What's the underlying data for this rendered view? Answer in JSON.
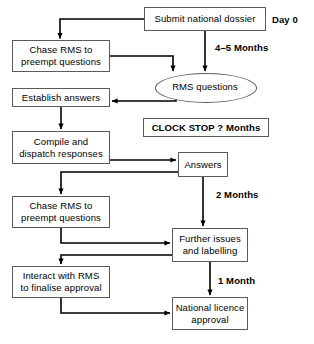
{
  "diagram": {
    "line_color": "#000000",
    "box_border_color": "#5a5a5a",
    "background": "#ffffff"
  },
  "nodes": [
    {
      "id": "submit-national-dossier",
      "label": "Submit national dossier",
      "shape": "rect",
      "x": 144,
      "y": 7,
      "w": 122,
      "h": 24
    },
    {
      "id": "chase-rms-1",
      "label": "Chase RMS to\npreempt questions",
      "shape": "rect",
      "x": 12,
      "y": 40,
      "w": 98,
      "h": 32
    },
    {
      "id": "rms-questions",
      "label": "RMS questions",
      "shape": "ellipse",
      "x": 155,
      "y": 73,
      "w": 100,
      "h": 28
    },
    {
      "id": "establish-answers",
      "label": "Establish answers",
      "shape": "rect",
      "x": 12,
      "y": 88,
      "w": 98,
      "h": 19
    },
    {
      "id": "clock-stop",
      "label": "CLOCK STOP ? Months",
      "shape": "rect-bold",
      "x": 143,
      "y": 118,
      "w": 126,
      "h": 19
    },
    {
      "id": "compile-dispatch-responses",
      "label": "Compile and\ndispatch responses",
      "shape": "rect",
      "x": 12,
      "y": 131,
      "w": 98,
      "h": 33
    },
    {
      "id": "answers",
      "label": "Answers",
      "shape": "rect",
      "x": 178,
      "y": 152,
      "w": 50,
      "h": 25
    },
    {
      "id": "chase-rms-2",
      "label": "Chase RMS to\npreempt questions",
      "shape": "rect",
      "x": 12,
      "y": 196,
      "w": 98,
      "h": 32
    },
    {
      "id": "further-issues-labelling",
      "label": "Further issues\nand labelling",
      "shape": "rect",
      "x": 172,
      "y": 228,
      "w": 76,
      "h": 34
    },
    {
      "id": "interact-with-rms",
      "label": "Interact with RMS\nto finalise approval",
      "shape": "rect",
      "x": 12,
      "y": 266,
      "w": 98,
      "h": 32
    },
    {
      "id": "national-licence-approval",
      "label": "National licence\napproval",
      "shape": "rect",
      "x": 172,
      "y": 297,
      "w": 76,
      "h": 33
    }
  ],
  "time_labels": [
    {
      "id": "day-0",
      "text": "Day 0",
      "x": 272,
      "y": 14
    },
    {
      "id": "four-five-months",
      "text": "4–5 Months",
      "x": 215,
      "y": 42
    },
    {
      "id": "two-months",
      "text": "2 Months",
      "x": 216,
      "y": 189
    },
    {
      "id": "one-month",
      "text": "1 Month",
      "x": 218,
      "y": 275
    }
  ]
}
